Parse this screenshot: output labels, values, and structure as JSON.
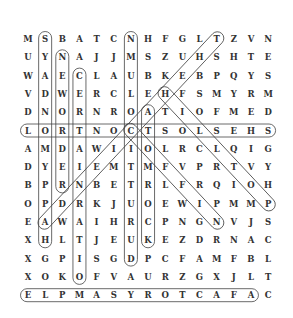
{
  "puzzle": {
    "grid": [
      "MSBATCNHFGLTZVN",
      "UYNAJJMSZUHSHTE",
      "WAECLAUBKEBPQYS",
      "VDWERCLEHFSMYRM",
      "DNORNROATIOFMED",
      "LORTNOCTSOLSEHS",
      "AMDAWIIOLRCLQIG",
      "DYEIEMTMFVPRTVY",
      "BPRNBETRLFRQIOH",
      "OPDRKJUOEWIPMMP",
      "EAWAIHRCPNGNVJS",
      "XHLTJEUKEZDRNAC",
      "XGPISGDPCFAMFBL",
      "XOKOFVAURZGXJLT",
      "ELPMASYROTCAFAC"
    ],
    "found_words": [
      {
        "word": "HAPPYMONDAYS",
        "start": [
          12,
          2
        ],
        "end": [
          1,
          2
        ]
      },
      {
        "word": "NEWORDER",
        "start": [
          2,
          3
        ],
        "end": [
          9,
          3
        ]
      },
      {
        "word": "CERTAINRATIO",
        "start": [
          3,
          4
        ],
        "end": [
          14,
          4
        ]
      },
      {
        "word": "DURUTTICOLUMN",
        "start": [
          13,
          7
        ],
        "end": [
          1,
          7
        ]
      },
      {
        "word": "ATOMROCK",
        "start": [
          5,
          8
        ],
        "end": [
          12,
          8
        ]
      },
      {
        "word": "SHESLOSTCONTROL",
        "start": [
          6,
          15
        ],
        "end": [
          6,
          1
        ]
      },
      {
        "word": "AFACTORYSAMPLE",
        "start": [
          15,
          14
        ],
        "end": [
          15,
          1
        ]
      },
      {
        "word": "THEHACIENDA",
        "start": [
          1,
          12
        ],
        "end": [
          11,
          2
        ]
      },
      {
        "word": "HILLTOP",
        "start": [
          4,
          9
        ],
        "end": [
          10,
          15
        ]
      },
      {
        "word": "COFFIN",
        "start": [
          6,
          7
        ],
        "end": [
          11,
          12
        ]
      }
    ],
    "colors": {
      "letter": "#333333",
      "outline": "#444444",
      "background": "#ffffff"
    }
  }
}
